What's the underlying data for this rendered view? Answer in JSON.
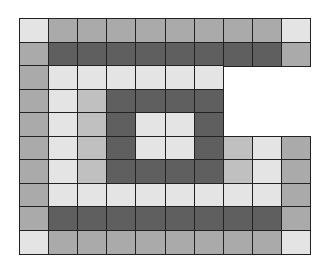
{
  "grid": {
    "rows": 10,
    "cols": 10,
    "cell_width": 29.1,
    "cell_height": 23.5,
    "palette": {
      "L": "#e4e4e4",
      "M": "#aaaaaa",
      "B": "#c0c0c0",
      "D": "#5f5f5f"
    },
    "cells": [
      "LMMMMMMMML",
      "MDDDDDDDDM",
      "MLLLLLL...",
      "MLBDDDD...",
      "MLBDLLD...",
      "MLBDLLDBLM",
      "MLBDDDDBLM",
      "MLLLLLLLLM",
      "MDDDDDDDDM",
      "LMMMMMMMML"
    ]
  }
}
